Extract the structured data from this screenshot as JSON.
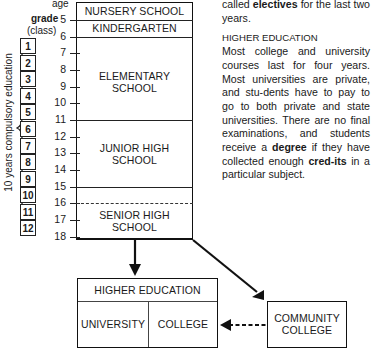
{
  "diagram": {
    "age_label": "age",
    "grade_label": "grade",
    "class_label": "(class)",
    "compulsory_label": "10 years compulsory education",
    "ages": [
      "5",
      "6",
      "7",
      "8",
      "9",
      "10",
      "11",
      "12",
      "13",
      "14",
      "15",
      "16",
      "17",
      "18"
    ],
    "grades": [
      "1",
      "2",
      "3",
      "4",
      "5",
      "6",
      "7",
      "8",
      "9",
      "10",
      "11",
      "12"
    ],
    "stages": {
      "nursery": "NURSERY SCHOOL",
      "kindergarten": "KINDERGARTEN",
      "elementary_1": "ELEMENTARY",
      "elementary_2": "SCHOOL",
      "junior_1": "JUNIOR HIGH",
      "junior_2": "SCHOOL",
      "senior_1": "SENIOR HIGH",
      "senior_2": "SCHOOL"
    },
    "higher_ed": {
      "title": "HIGHER EDUCATION",
      "university": "UNIVERSITY",
      "college": "COLLEGE"
    },
    "community_college": {
      "line1": "COMMUNITY",
      "line2": "COLLEGE"
    }
  },
  "text": {
    "p1_pre": "called ",
    "p1_bold": "electives",
    "p1_post": " for the last two years.",
    "section_head": "HIGHER EDUCATION",
    "p2_pre": "Most college and university courses last for four years. Most universities are private, and stu-dents have to pay to go to both private and state universities. There are no final examinations, and students receive a ",
    "p2_bold1": "degree",
    "p2_mid": " if they have collected enough ",
    "p2_bold2": "cred-its",
    "p2_post": " in a particular subject."
  }
}
